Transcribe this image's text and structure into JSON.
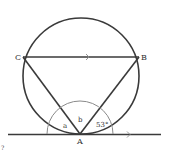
{
  "diagram": {
    "type": "circle-geometry",
    "points": {
      "A": {
        "label": "A",
        "x": 80,
        "y": 134
      },
      "B": {
        "label": "B",
        "x": 139,
        "y": 57
      },
      "C": {
        "label": "C",
        "x": 23,
        "y": 57
      }
    },
    "angles": {
      "a": "a",
      "b": "b",
      "given": "53°"
    },
    "stray_mark": "?",
    "colors": {
      "line": "#3a3a3a",
      "arc": "#8a8a8a",
      "text": "#333333"
    }
  }
}
